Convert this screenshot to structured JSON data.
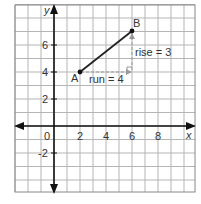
{
  "chart_data": {
    "type": "line",
    "title": "",
    "xlabel": "x",
    "ylabel": "y",
    "xlim": [
      -4,
      10
    ],
    "ylim": [
      -5,
      9
    ],
    "grid": true,
    "x_ticks": [
      "0",
      "2",
      "4",
      "6",
      "8"
    ],
    "y_ticks": [
      "6",
      "4",
      "2",
      "-2"
    ],
    "points": [
      {
        "name": "A",
        "x": 2,
        "y": 4
      },
      {
        "name": "B",
        "x": 6,
        "y": 7
      }
    ],
    "segment": {
      "from": "A",
      "to": "B"
    },
    "annotations": [
      {
        "text": "run = 4",
        "type": "horizontal",
        "from": [
          2,
          4
        ],
        "to": [
          6,
          4
        ]
      },
      {
        "text": "rise = 3",
        "type": "vertical",
        "from": [
          6,
          4
        ],
        "to": [
          6,
          7
        ]
      }
    ]
  },
  "labels": {
    "x_axis": "x",
    "y_axis": "y",
    "origin": "0",
    "x2": "2",
    "x4": "4",
    "x6": "6",
    "x8": "8",
    "y6": "6",
    "y4": "4",
    "y2": "2",
    "yneg2": "-2",
    "point_a": "A",
    "point_b": "B",
    "run": "run = 4",
    "rise": "rise = 3"
  }
}
